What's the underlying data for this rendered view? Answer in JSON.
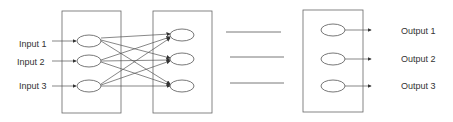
{
  "diagram": {
    "type": "neural-network",
    "inputs": [
      {
        "label": "Input 1"
      },
      {
        "label": "Input 2"
      },
      {
        "label": "Input 3"
      }
    ],
    "outputs": [
      {
        "label": "Output 1"
      },
      {
        "label": "Output 2"
      },
      {
        "label": "Output 3"
      }
    ],
    "layers": [
      {
        "name": "input-layer",
        "nodes": 3
      },
      {
        "name": "hidden-layer",
        "nodes": 3
      },
      {
        "name": "output-layer",
        "nodes": 3
      }
    ],
    "colors": {
      "stroke": "#555555",
      "background": "#ffffff"
    }
  }
}
